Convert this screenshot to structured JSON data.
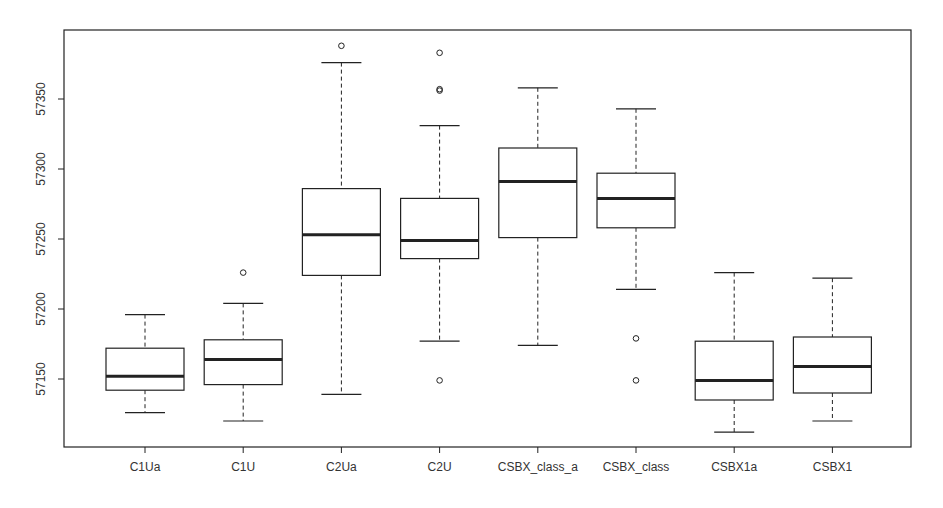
{
  "chart_data": {
    "type": "boxplot",
    "title": "",
    "xlabel": "",
    "ylabel": "",
    "ylim": [
      57100,
      57400
    ],
    "yticks": [
      57150,
      57200,
      57250,
      57300,
      57350
    ],
    "grid": false,
    "legend": null,
    "categories": [
      "C1Ua",
      "C1U",
      "C2Ua",
      "C2U",
      "CSBX_class_a",
      "CSBX_class",
      "CSBX1a",
      "CSBX1"
    ],
    "boxes": [
      {
        "name": "C1Ua",
        "lower_whisker": 57126,
        "q1": 57142,
        "median": 57152,
        "q3": 57172,
        "upper_whisker": 57196,
        "outliers": []
      },
      {
        "name": "C1U",
        "lower_whisker": 57120,
        "q1": 57146,
        "median": 57164,
        "q3": 57178,
        "upper_whisker": 57204,
        "outliers": [
          57226
        ]
      },
      {
        "name": "C2Ua",
        "lower_whisker": 57139,
        "q1": 57224,
        "median": 57253,
        "q3": 57286,
        "upper_whisker": 57376,
        "outliers": [
          57388
        ]
      },
      {
        "name": "C2U",
        "lower_whisker": 57177,
        "q1": 57236,
        "median": 57249,
        "q3": 57279,
        "upper_whisker": 57331,
        "outliers": [
          57383,
          57357,
          57356,
          57149
        ]
      },
      {
        "name": "CSBX_class_a",
        "lower_whisker": 57174,
        "q1": 57251,
        "median": 57291,
        "q3": 57315,
        "upper_whisker": 57358,
        "outliers": []
      },
      {
        "name": "CSBX_class",
        "lower_whisker": 57214,
        "q1": 57258,
        "median": 57279,
        "q3": 57297,
        "upper_whisker": 57343,
        "outliers": [
          57179,
          57149
        ]
      },
      {
        "name": "CSBX1a",
        "lower_whisker": 57112,
        "q1": 57135,
        "median": 57149,
        "q3": 57177,
        "upper_whisker": 57226,
        "outliers": []
      },
      {
        "name": "CSBX1",
        "lower_whisker": 57120,
        "q1": 57140,
        "median": 57159,
        "q3": 57180,
        "upper_whisker": 57222,
        "outliers": []
      }
    ],
    "colors": {
      "line": "#222222",
      "box_fill": "#ffffff",
      "text": "#333333"
    }
  }
}
